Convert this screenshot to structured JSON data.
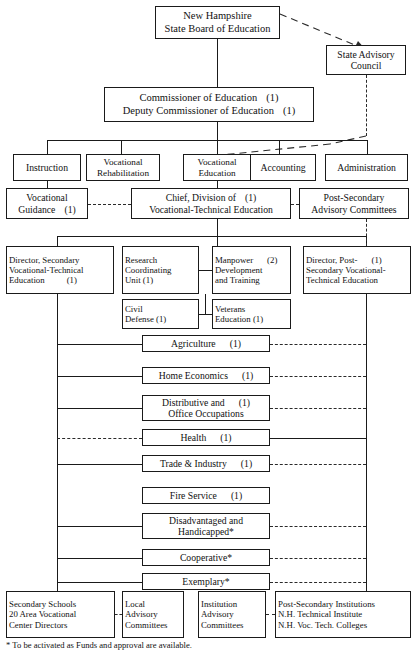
{
  "diagram": {
    "footnote": "* To be activated as Funds and approval are available."
  },
  "nodes": {
    "board": {
      "line1": "New Hampshire",
      "line2": "State Board of Education"
    },
    "advisory": {
      "line1": "State Advisory",
      "line2": "Council"
    },
    "commissioner": {
      "line1": "Commissioner of Education",
      "count1": "(1)",
      "line2": "Deputy Commissioner of Education",
      "count2": "(1)"
    },
    "instruction": {
      "line1": "Instruction"
    },
    "voc_rehab": {
      "line1": "Vocational",
      "line2": "Rehabilitation"
    },
    "voc_ed": {
      "line1": "Vocational",
      "line2": "Education"
    },
    "accounting": {
      "line1": "Accounting"
    },
    "administration": {
      "line1": "Administration"
    },
    "voc_guidance": {
      "line1": "Vocational",
      "line2": "Guidance",
      "count2": "(1)"
    },
    "chief": {
      "line1": "Chief, Division of",
      "count1": "(1)",
      "line2": "Vocational-Technical Education"
    },
    "post_sec_adv": {
      "line1": "Post-Secondary",
      "line2": "Advisory Committees"
    },
    "dir_secondary": {
      "line1": "Director, Secondary",
      "line2": "Vocational-Technical",
      "line3": "Education",
      "count3": "(1)"
    },
    "research": {
      "line1": "Research",
      "line2": "Coordinating",
      "line3": "Unit",
      "count3": "(1)"
    },
    "manpower": {
      "line1": "Manpower",
      "count1": "(2)",
      "line2": "Development",
      "line3": "and Training"
    },
    "dir_postsec": {
      "line1": "Director, Post-",
      "count1": "(1)",
      "line2": "Secondary Vocational-",
      "line3": "Technical Education"
    },
    "civil_defense": {
      "line1": "Civil",
      "line2": "Defense",
      "count2": "(1)"
    },
    "veterans": {
      "line1": "Veterans",
      "line2": "Education",
      "count2": "(1)"
    },
    "secondary_schools": {
      "line1": "Secondary Schools",
      "line2": "20 Area Vocational",
      "line3": "Center Directors"
    },
    "local_adv": {
      "line1": "Local",
      "line2": "Advisory",
      "line3": "Committees"
    },
    "inst_adv": {
      "line1": "Institution",
      "line2": "Advisory",
      "line3": "Committees"
    },
    "post_sec_inst": {
      "line1": "Post-Secondary Institutions",
      "line2": "N.H. Technical Institute",
      "line3": "N.H. Voc. Tech. Colleges"
    }
  },
  "programs": [
    {
      "key": "agriculture",
      "line1": "Agriculture",
      "count1": "(1)",
      "line2": "",
      "solid_left": true,
      "dashed_right": true
    },
    {
      "key": "home_ec",
      "line1": "Home Economics",
      "count1": "(1)",
      "line2": "",
      "solid_left": true,
      "dashed_right": true
    },
    {
      "key": "distributive",
      "line1": "Distributive and",
      "count1": "(1)",
      "line2": "Office Occupations",
      "solid_left": true,
      "dashed_right": true
    },
    {
      "key": "health",
      "line1": "Health",
      "count1": "(1)",
      "line2": "",
      "solid_left": false,
      "dashed_right": false
    },
    {
      "key": "trade",
      "line1": "Trade & Industry",
      "count1": "(1)",
      "line2": "",
      "solid_left": true,
      "dashed_right": true
    },
    {
      "key": "fire",
      "line1": "Fire Service",
      "count1": "(1)",
      "line2": "",
      "solid_left": false,
      "dashed_right": false
    },
    {
      "key": "disadvantaged",
      "line1": "Disadvantaged and",
      "count1": "",
      "line2": "Handicapped*",
      "solid_left": true,
      "dashed_right": true
    },
    {
      "key": "cooperative",
      "line1": "Cooperative*",
      "count1": "",
      "line2": "",
      "solid_left": true,
      "dashed_right": true
    },
    {
      "key": "exemplary",
      "line1": "Exemplary*",
      "count1": "",
      "line2": "",
      "solid_left": true,
      "dashed_right": true
    }
  ],
  "colors": {
    "line": "#1a1a1a",
    "text": "#111111",
    "background": "#ffffff"
  }
}
